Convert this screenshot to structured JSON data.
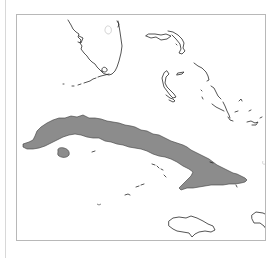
{
  "map": {
    "type": "region-map",
    "highlighted_country": "Cuba",
    "visible_regions": [
      "Florida",
      "Bahamas",
      "Cuba",
      "Isla de la Juventud",
      "Cayman Islands",
      "Jamaica",
      "Hispaniola"
    ],
    "colors": {
      "highlight_fill": "#8c8c8c",
      "coastline": "#2a2a2a",
      "frame": "#b8b8b8",
      "background": "#ffffff"
    }
  }
}
